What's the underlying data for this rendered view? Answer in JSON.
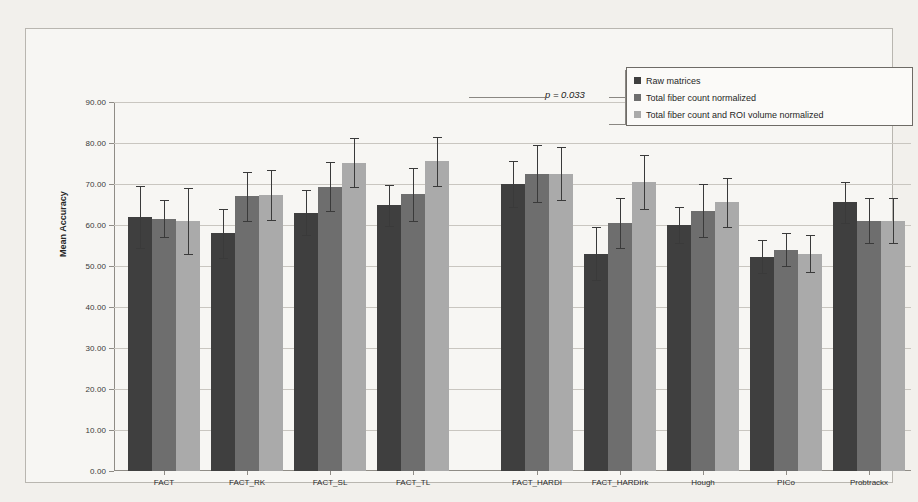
{
  "chart_data": {
    "type": "bar",
    "title": "",
    "xlabel": "",
    "ylabel": "Mean Accuracy",
    "ylim": [
      0,
      90
    ],
    "ytick_step": 10,
    "ytick_labels": [
      "0.00",
      "10.00",
      "20.00",
      "30.00",
      "40.00",
      "50.00",
      "60.00",
      "70.00",
      "80.00",
      "90.00"
    ],
    "grid": true,
    "legend_position": "top-right",
    "categories": [
      "FACT",
      "FACT_RK",
      "FACT_SL",
      "FACT_TL",
      "FACT_HARDI",
      "FACT_HARDIrk",
      "Hough",
      "PICo",
      "Probtrackx"
    ],
    "series": [
      {
        "name": "Raw matrices",
        "color": "#3f3f3f",
        "values": [
          62.0,
          58.0,
          63.0,
          64.8,
          70.0,
          53.0,
          60.0,
          52.3,
          65.5
        ],
        "errors": [
          7.5,
          6.0,
          5.5,
          5.0,
          5.5,
          6.5,
          4.5,
          4.0,
          5.0
        ]
      },
      {
        "name": "Total fiber count normalized",
        "color": "#6e6e6e",
        "values": [
          61.5,
          67.0,
          69.3,
          67.5,
          72.5,
          60.5,
          63.5,
          54.0,
          61.0
        ],
        "errors": [
          4.5,
          6.0,
          6.0,
          6.5,
          7.0,
          6.0,
          6.5,
          4.0,
          5.5
        ]
      },
      {
        "name": "Total fiber count and ROI volume normalized",
        "color": "#aaaaaa",
        "values": [
          61.0,
          67.3,
          75.2,
          75.5,
          72.5,
          70.5,
          65.5,
          53.0,
          61.0
        ],
        "errors": [
          8.0,
          6.0,
          6.0,
          6.0,
          6.5,
          6.5,
          6.0,
          4.5,
          5.5
        ]
      }
    ],
    "group_breaks_after": [
      "FACT_TL"
    ],
    "annotations": [
      {
        "name": "p-value",
        "text": "p = 0.033",
        "value": 0.033
      }
    ]
  },
  "legend": {
    "items": [
      {
        "label": "Raw matrices",
        "color": "#3f3f3f"
      },
      {
        "label": "Total fiber count normalized",
        "color": "#6e6e6e"
      },
      {
        "label": "Total fiber count and ROI volume normalized",
        "color": "#aaaaaa"
      }
    ]
  },
  "axes": {
    "y_title": "Mean Accuracy"
  },
  "annotation": {
    "p_text": "p = 0.033"
  }
}
